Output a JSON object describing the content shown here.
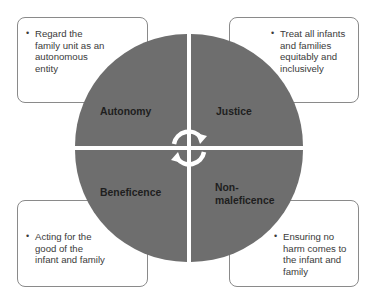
{
  "diagram": {
    "colors": {
      "quadrant_fill": "#6e6e6e",
      "box_border": "#8a8a8a",
      "arrow": "#ffffff",
      "text": "#3a3a3a",
      "label": "#1e1e1e"
    },
    "quadrants": [
      {
        "position": "top-left",
        "label": "Autonomy",
        "description": "Regard the family unit as an autonomous entity"
      },
      {
        "position": "top-right",
        "label": "Justice",
        "description": "Treat all infants and families equitably and inclusively"
      },
      {
        "position": "bottom-left",
        "label": "Beneficence",
        "description": "Acting for the good of the infant and family"
      },
      {
        "position": "bottom-right",
        "label": "Non-maleficence",
        "label_line1": "Non-",
        "label_line2": "maleficence",
        "description": "Ensuring no harm comes to the infant and family"
      }
    ],
    "center_icon": "cycle-arrows-icon"
  }
}
